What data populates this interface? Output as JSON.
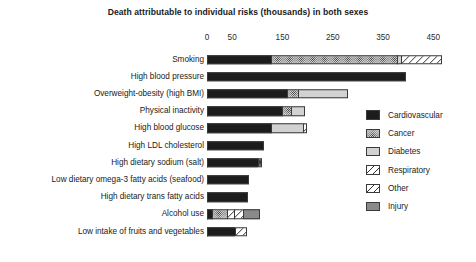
{
  "chart_data": {
    "type": "bar",
    "orientation": "horizontal",
    "stacked": true,
    "title": "Death attributable to individual risks (thousands) in both sexes",
    "xlabel": "",
    "ylabel": "",
    "xlim": [
      0,
      476
    ],
    "xticks": [
      0,
      50,
      150,
      250,
      350,
      450
    ],
    "xtick_labels": [
      "0",
      "50",
      "150",
      "250",
      "350",
      "450"
    ],
    "grid": false,
    "legend_position": "right",
    "units": "thousands of deaths",
    "categories": [
      "Smoking",
      "High blood pressure",
      "Overweight-obesity (high BMI)",
      "Physical inactivity",
      "High blood glucose",
      "High LDL cholesterol",
      "High dietary sodium (salt)",
      "Low dietary omega-3 fatty acids (seafood)",
      "High dietary trans fatty acids",
      "Alcohol use",
      "Low intake of fruits and vegetables"
    ],
    "series": [
      {
        "name": "Cardiovascular",
        "color": "#1c1c1c",
        "pattern": "solid-black",
        "values": [
          128,
          395,
          160,
          150,
          128,
          113,
          102,
          84,
          82,
          10,
          55
        ]
      },
      {
        "name": "Cancer",
        "color": "#cfcfcf",
        "pattern": "dotted",
        "values": [
          250,
          0,
          20,
          17,
          0,
          0,
          8,
          0,
          0,
          30,
          0
        ]
      },
      {
        "name": "Diabetes",
        "color": "#d2d2d2",
        "pattern": "light-grey",
        "values": [
          8,
          0,
          100,
          28,
          62,
          0,
          0,
          0,
          0,
          0,
          0
        ]
      },
      {
        "name": "Respiratory",
        "color": "#ffffff",
        "pattern": "diagonal-hatch",
        "values": [
          81,
          0,
          0,
          0,
          8,
          0,
          0,
          0,
          0,
          14,
          25
        ]
      },
      {
        "name": "Other",
        "color": "#ffffff",
        "pattern": "diagonal-hatch",
        "values": [
          0,
          0,
          0,
          0,
          0,
          0,
          0,
          0,
          0,
          18,
          0
        ]
      },
      {
        "name": "Injury",
        "color": "#8a8a8a",
        "pattern": "mid-grey",
        "values": [
          0,
          0,
          0,
          0,
          0,
          0,
          0,
          0,
          0,
          33,
          0
        ]
      }
    ],
    "totals": [
      467,
      395,
      280,
      195,
      198,
      113,
      110,
      84,
      82,
      105,
      80
    ]
  },
  "legend": {
    "items": [
      {
        "label": "Cardiovascular",
        "key": "Cardiovascular"
      },
      {
        "label": "Cancer",
        "key": "Cancer"
      },
      {
        "label": "Diabetes",
        "key": "Diabetes"
      },
      {
        "label": "Respiratory",
        "key": "Respiratory"
      },
      {
        "label": "Other",
        "key": "Other"
      },
      {
        "label": "Injury",
        "key": "Injury"
      }
    ]
  }
}
